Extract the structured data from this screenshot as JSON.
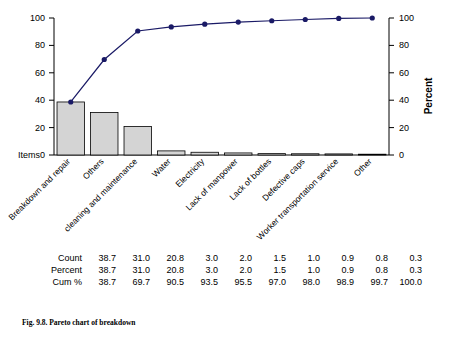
{
  "caption": "Fig. 9.8. Pareto chart of breakdown",
  "axes": {
    "items_label": "Items",
    "right_axis_title": "Percent",
    "left_ticks": [
      0,
      20,
      40,
      60,
      80,
      100
    ],
    "right_ticks": [
      0,
      20,
      40,
      60,
      80,
      100
    ]
  },
  "table": {
    "rows": [
      {
        "label": "Count",
        "values": [
          "38.7",
          "31.0",
          "20.8",
          "3.0",
          "2.0",
          "1.5",
          "1.0",
          "0.9",
          "0.8",
          "0.3"
        ]
      },
      {
        "label": "Percent",
        "values": [
          "38.7",
          "31.0",
          "20.8",
          "3.0",
          "2.0",
          "1.5",
          "1.0",
          "0.9",
          "0.8",
          "0.3"
        ]
      },
      {
        "label": "Cum %",
        "values": [
          "38.7",
          "69.7",
          "90.5",
          "93.5",
          "95.5",
          "97.0",
          "98.0",
          "98.9",
          "99.7",
          "100.0"
        ]
      }
    ]
  },
  "chart_data": {
    "type": "bar",
    "title": "",
    "xlabel": "Items",
    "ylabel": "",
    "ylabel_right": "Percent",
    "ylim": [
      0,
      100
    ],
    "ylim_right": [
      0,
      100
    ],
    "grid": false,
    "categories": [
      "Breakdown and repair",
      "Others",
      "cleaning and maintenance",
      "Water",
      "Electricity",
      "Lack of manpower",
      "Lack of bottles",
      "Defective caps",
      "Worker transportation service",
      "Other"
    ],
    "series": [
      {
        "name": "Count",
        "type": "bar",
        "values": [
          38.7,
          31.0,
          20.8,
          3.0,
          2.0,
          1.5,
          1.0,
          0.9,
          0.8,
          0.3
        ]
      },
      {
        "name": "Cum %",
        "type": "line",
        "values": [
          38.7,
          69.7,
          90.5,
          93.5,
          95.5,
          97.0,
          98.0,
          98.9,
          99.7,
          100.0
        ]
      }
    ],
    "colors": {
      "bar_fill": "#d4d4d4",
      "bar_edge": "#000000",
      "line": "#1a1a66",
      "marker": "#1a1a66",
      "axis": "#000000"
    }
  }
}
